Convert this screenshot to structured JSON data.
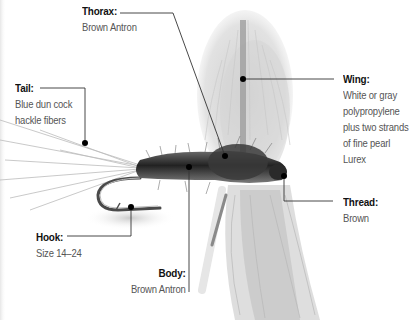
{
  "diagram": {
    "colors": {
      "background": "#ffffff",
      "label_title": "#111111",
      "label_text": "#555555",
      "leader_line": "#333333",
      "dot": "#000000",
      "body_dark": "#2e2e2e",
      "wing_light": "#d9d9d9",
      "hook": "#555555"
    },
    "callouts": {
      "thorax": {
        "title": "Thorax:",
        "lines": [
          "Brown Antron"
        ]
      },
      "tail": {
        "title": "Tail:",
        "lines": [
          "Blue dun cock",
          "hackle fibers"
        ]
      },
      "wing": {
        "title": "Wing:",
        "lines": [
          "White or gray",
          "polypropylene",
          "plus two strands",
          "of fine pearl",
          "Lurex"
        ]
      },
      "thread": {
        "title": "Thread:",
        "lines": [
          "Brown"
        ]
      },
      "hook": {
        "title": "Hook:",
        "lines": [
          "Size 14–24"
        ]
      },
      "body": {
        "title": "Body:",
        "lines": [
          "Brown Antron"
        ]
      }
    }
  }
}
